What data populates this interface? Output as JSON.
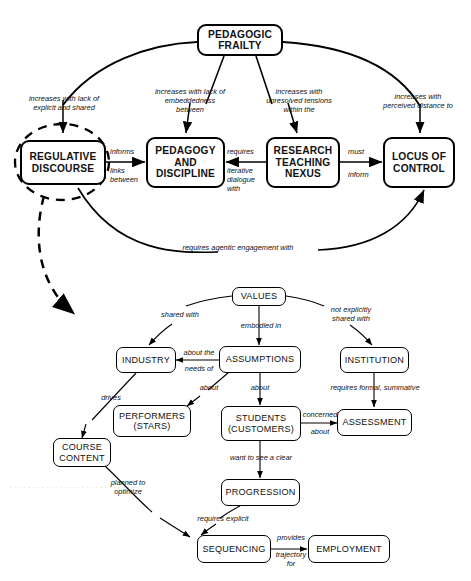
{
  "diagram": {
    "nodes": {
      "pedagogic_frailty": "PEDAGOGIC\nFRAILTY",
      "regulative_discourse": "REGULATIVE\nDISCOURSE",
      "pedagogy_discipline": "PEDAGOGY\nAND\nDISCIPLINE",
      "research_teaching_nexus": "RESEARCH\nTEACHING\nNEXUS",
      "locus_of_control": "LOCUS\nOF\nCONTROL",
      "values": "VALUES",
      "assumptions": "ASSUMPTIONS",
      "institution": "INSTITUTION",
      "industry": "INDUSTRY",
      "performers": "PERFORMERS\n(STARS)",
      "students": "STUDENTS\n(CUSTOMERS)",
      "assessment": "ASSESSMENT",
      "course_content": "COURSE\nCONTENT",
      "progression": "PROGRESSION",
      "sequencing": "SEQUENCING",
      "employment": "EMPLOYMENT"
    },
    "edge_labels": {
      "frailty_to_regulative": "increases with lack of\nexplicit and shared",
      "frailty_to_pedagogy": "increases with lack of\nembeddedness\nbetween",
      "frailty_to_nexus": "increases with\nunresolved tensions\nwithin the",
      "frailty_to_locus": "increases with\nperceived distance to",
      "regulative_informs": "informs",
      "regulative_links_between": "links\nbetween",
      "pedagogy_requires": "requires",
      "pedagogy_iterative": "iterative\ndialogue\nwith",
      "nexus_must": "must",
      "nexus_inform": "inform",
      "agentic": "requires agentic engagement with",
      "values_shared_with": "shared with",
      "values_embodied_in": "embodied in",
      "values_not_shared": "not explicitly\nshared with",
      "assumptions_about_the": "about the",
      "assumptions_needs_of": "needs of",
      "assumptions_about_left": "about",
      "assumptions_about_down": "about",
      "institution_requires": "requires formal, summative",
      "students_concerned": "concerned",
      "students_about": "about",
      "students_want": "want to see a clear",
      "industry_drives": "drives",
      "course_planned": "planned to\noptimize",
      "progression_requires": "requires explicit",
      "sequencing_provides": "provides",
      "sequencing_trajectory": "trajectory\nfor"
    },
    "style": {
      "stroke": "#000000",
      "background": "#ffffff",
      "dashed_highlight": "#000000"
    }
  }
}
